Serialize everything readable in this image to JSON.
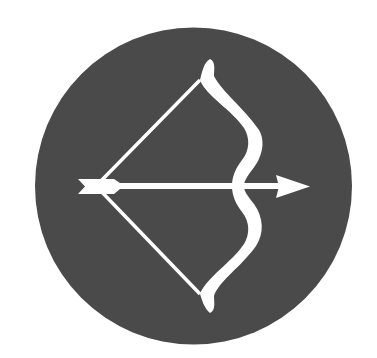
{
  "icon": {
    "name": "bow-and-arrow-icon",
    "background_color": "#4a4a4a",
    "foreground_color": "#ffffff",
    "page_background": "#ffffff"
  }
}
